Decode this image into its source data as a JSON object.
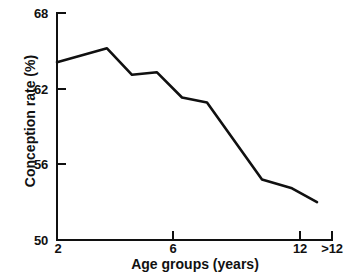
{
  "chart_data": {
    "type": "line",
    "title": "",
    "subtitle": "",
    "xlabel": "Age groups (years)",
    "ylabel": "Conception rate (%)",
    "xlim": [
      2,
      13
    ],
    "ylim": [
      50,
      68
    ],
    "grid": false,
    "legend": null,
    "x_tick_labels": [
      "2",
      "6",
      "12",
      ">12"
    ],
    "x_tick_values": [
      2,
      6,
      12,
      13
    ],
    "y_tick_labels": [
      "68",
      "62",
      "56",
      "50"
    ],
    "y_tick_values": [
      68,
      62,
      56,
      50
    ],
    "series": [
      {
        "name": "Conception rate",
        "color": "#101010",
        "x": [
          2,
          4,
          5,
          6,
          7,
          8,
          10.2,
          11.4,
          12.4
        ],
        "y": [
          64.1,
          65.2,
          63.1,
          63.3,
          61.3,
          60.9,
          54.8,
          54.1,
          53.0
        ],
        "points": [
          {
            "age": "2",
            "rate": 64.1
          },
          {
            "age": "4",
            "rate": 65.2
          },
          {
            "age": "5",
            "rate": 63.1
          },
          {
            "age": "6",
            "rate": 63.3
          },
          {
            "age": "7",
            "rate": 61.3
          },
          {
            "age": "8",
            "rate": 60.9
          },
          {
            "age": "10",
            "rate": 54.8
          },
          {
            "age": "11",
            "rate": 54.1
          },
          {
            "age": ">12",
            "rate": 53.0
          }
        ]
      }
    ],
    "annotations": []
  },
  "axes": {
    "y_ticks": [
      {
        "label": "68"
      },
      {
        "label": "62"
      },
      {
        "label": "56"
      },
      {
        "label": "50"
      }
    ],
    "x_ticks": [
      {
        "label": "2"
      },
      {
        "label": "6"
      },
      {
        "label": "12"
      },
      {
        "label": ">12"
      }
    ]
  },
  "colors": {
    "background": "#ffffff",
    "axis": "#101010",
    "line": "#101010",
    "text": "#111111"
  }
}
